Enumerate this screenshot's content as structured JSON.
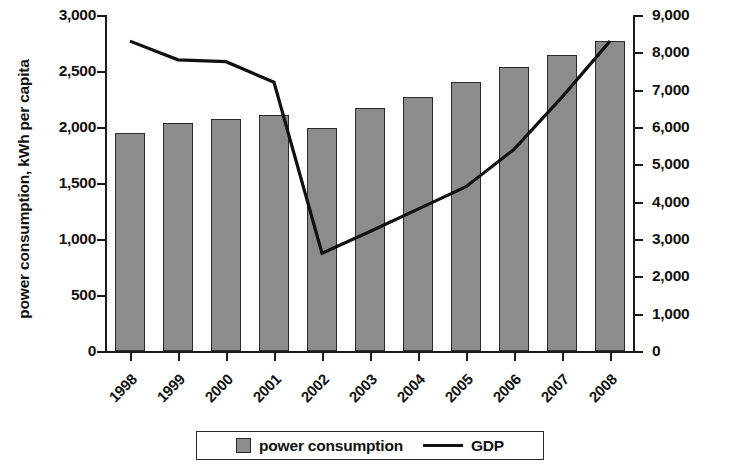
{
  "chart_data": {
    "type": "bar",
    "title": "",
    "subtitle": "",
    "xlabel": "",
    "ylabel": "power consumption, kWh per capita",
    "y2label": "GDP, US$ per capita",
    "grid": false,
    "legend_position": "bottom",
    "categories": [
      "1998",
      "1999",
      "2000",
      "2001",
      "2002",
      "2003",
      "2004",
      "2005",
      "2006",
      "2007",
      "2008"
    ],
    "ylim": [
      0,
      3000
    ],
    "y2lim": [
      0,
      9000
    ],
    "yticks": [
      "0",
      "500",
      "1,000",
      "1,500",
      "2,000",
      "2,500",
      "3,000"
    ],
    "ytick_values": [
      0,
      500,
      1000,
      1500,
      2000,
      2500,
      3000
    ],
    "y2ticks": [
      "0",
      "1,000",
      "2,000",
      "3,000",
      "4,000",
      "5,000",
      "6,000",
      "7,000",
      "8,000",
      "9,000"
    ],
    "y2tick_values": [
      0,
      1000,
      2000,
      3000,
      4000,
      5000,
      6000,
      7000,
      8000,
      9000
    ],
    "series": [
      {
        "name": "power consumption",
        "type": "bar",
        "axis": "left",
        "color": "#8c8c8c",
        "edge_color": "#2b2b2b",
        "values": [
          1950,
          2040,
          2070,
          2110,
          1990,
          2170,
          2270,
          2400,
          2540,
          2640,
          2770
        ]
      },
      {
        "name": "GDP",
        "type": "line",
        "axis": "right",
        "color": "#111111",
        "values": [
          8300,
          7800,
          7750,
          7200,
          2620,
          3200,
          3800,
          4400,
          5400,
          6800,
          8300
        ]
      }
    ],
    "legend": [
      {
        "label": "power consumption",
        "marker": "square-swatch"
      },
      {
        "label": "GDP",
        "marker": "line"
      }
    ]
  }
}
